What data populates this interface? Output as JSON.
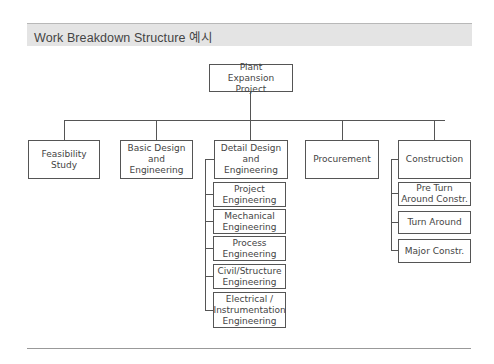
{
  "header": {
    "title": "Work Breakdown Structure 예시"
  },
  "wbs": {
    "root": "Plant Expansion Project",
    "level1": [
      {
        "label": "Feasibility Study",
        "children": []
      },
      {
        "label": "Basic Design and Engineering",
        "children": []
      },
      {
        "label": "Detail Design and Engineering",
        "children": [
          "Project Engineering",
          "Mechanical Engineering",
          "Process Engineering",
          "Civil/Structure Engineering",
          "Electrical / Instrumentation Engineering"
        ]
      },
      {
        "label": "Procurement",
        "children": []
      },
      {
        "label": "Construction",
        "children": [
          "Pre Turn Around Constr.",
          "Turn Around",
          "Major Constr."
        ]
      }
    ]
  },
  "colors": {
    "title_bar_bg": "#e4e4e4",
    "box_border": "#555555",
    "line": "#555555"
  }
}
